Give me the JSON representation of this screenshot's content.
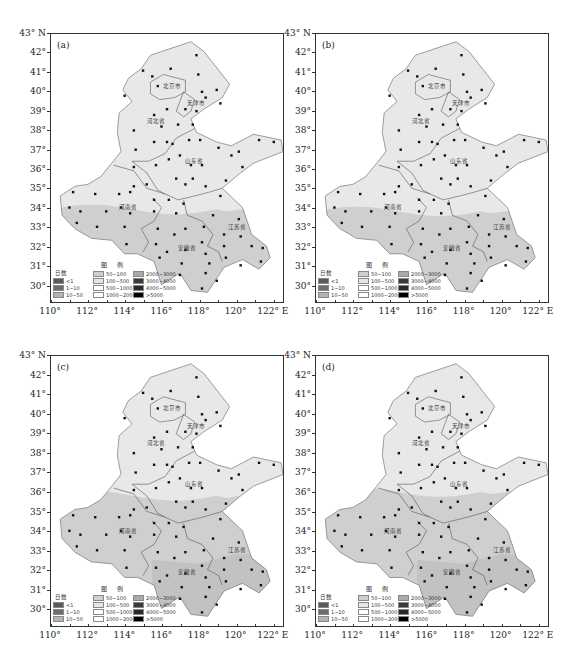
{
  "figure": {
    "caption": "",
    "axis": {
      "y_labels": [
        "43° N",
        "42°",
        "41°",
        "40°",
        "39°",
        "38°",
        "37°",
        "36°",
        "35°",
        "34°",
        "33°",
        "32°",
        "31°",
        "30°"
      ],
      "x_labels": [
        "110°",
        "112°",
        "114°",
        "116°",
        "118°",
        "120°",
        "122° E"
      ]
    },
    "legend": {
      "title": "图 例",
      "header": "日数",
      "items": [
        {
          "label": "<1",
          "color": "#5a5a5a"
        },
        {
          "label": "1~10",
          "color": "#6e6e6e"
        },
        {
          "label": "10~50",
          "color": "#b4b4b4"
        },
        {
          "label": "50~100",
          "color": "#cfcfcf"
        },
        {
          "label": "100~500",
          "color": "#e6e6e6"
        },
        {
          "label": "500~1000",
          "color": "#ffffff"
        },
        {
          "label": "1000~2000",
          "color": "#ffffff"
        },
        {
          "label": "2000~3000",
          "color": "#a9a9a9"
        },
        {
          "label": "3000~4000",
          "color": "#3a3a3a"
        },
        {
          "label": "4000~5000",
          "color": "#2a2a2a"
        },
        {
          "label": ">5000",
          "color": "#000000"
        }
      ]
    },
    "province_labels": [
      "北京市",
      "天津市",
      "河北省",
      "山东省",
      "河南省",
      "安徽省",
      "江苏省"
    ],
    "panels": [
      {
        "id": "a",
        "label": "(a)",
        "north_fill": "#e8e8e8",
        "south_fill": "#cfcfcf",
        "boundary_lat": 33.9
      },
      {
        "id": "b",
        "label": "(b)",
        "north_fill": "#e8e8e8",
        "south_fill": "#cfcfcf",
        "boundary_lat": 33.8
      },
      {
        "id": "c",
        "label": "(c)",
        "north_fill": "#e8e8e8",
        "south_fill": "#cfcfcf",
        "boundary_lat": 35.8
      },
      {
        "id": "d",
        "label": "(d)",
        "north_fill": "#e8e8e8",
        "south_fill": "#cfcfcf",
        "boundary_lat": 36.0
      }
    ]
  }
}
